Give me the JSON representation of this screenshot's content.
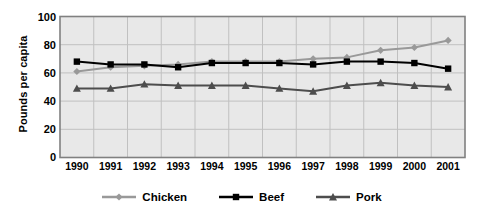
{
  "chart_data": {
    "type": "line",
    "title": "",
    "xlabel": "",
    "ylabel": "Pounds per capita",
    "categories": [
      "1990",
      "1991",
      "1992",
      "1993",
      "1994",
      "1995",
      "1996",
      "1997",
      "1998",
      "1999",
      "2000",
      "2001"
    ],
    "x": [
      1990,
      1991,
      1992,
      1993,
      1994,
      1995,
      1996,
      1997,
      1998,
      1999,
      2000,
      2001
    ],
    "ylim": [
      0,
      100
    ],
    "yticks": [
      0,
      20,
      40,
      60,
      80,
      100
    ],
    "grid": true,
    "legend_position": "bottom",
    "series": [
      {
        "name": "Chicken",
        "color": "#999999",
        "marker": "diamond",
        "values": [
          61,
          64,
          65,
          66,
          68,
          68,
          68,
          70,
          71,
          76,
          78,
          83
        ]
      },
      {
        "name": "Beef",
        "color": "#000000",
        "marker": "square",
        "values": [
          68,
          66,
          66,
          64,
          67,
          67,
          67,
          66,
          68,
          68,
          67,
          63
        ]
      },
      {
        "name": "Pork",
        "color": "#4d4d4d",
        "marker": "triangle",
        "values": [
          49,
          49,
          52,
          51,
          51,
          51,
          49,
          47,
          51,
          53,
          51,
          50
        ]
      }
    ]
  },
  "axes": {
    "y_title": "Pounds per capita",
    "y_tick_labels": [
      "100",
      "80",
      "60",
      "40",
      "20",
      "0"
    ],
    "x_tick_labels": [
      "1990",
      "1991",
      "1992",
      "1993",
      "1994",
      "1995",
      "1996",
      "1997",
      "1998",
      "1999",
      "2000",
      "2001"
    ]
  },
  "legend": {
    "entries": [
      {
        "label": "Chicken",
        "color": "#999999",
        "marker": "diamond"
      },
      {
        "label": "Beef",
        "color": "#000000",
        "marker": "square"
      },
      {
        "label": "Pork",
        "color": "#4d4d4d",
        "marker": "triangle"
      }
    ]
  },
  "style": {
    "plot_background": "#e8e8e8",
    "grid_color": "#c0c0c0",
    "border_color": "#808080",
    "page_background": "#ffffff"
  }
}
